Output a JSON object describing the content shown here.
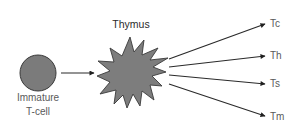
{
  "diagram": {
    "source_node": {
      "label_line1": "Immature",
      "label_line2": "T-cell",
      "shape": "circle",
      "fill": "#7b7b7b",
      "stroke": "#3a3a3a"
    },
    "organ_node": {
      "label": "Thymus",
      "shape": "starburst",
      "fill": "#7d7d7d",
      "stroke": "#3a3a3a"
    },
    "outputs": [
      {
        "label": "Tc"
      },
      {
        "label": "Th"
      },
      {
        "label": "Ts"
      },
      {
        "label": "Tm"
      }
    ],
    "arrow_color": "#2a2a2a",
    "label_color": "#5a5a5a"
  }
}
